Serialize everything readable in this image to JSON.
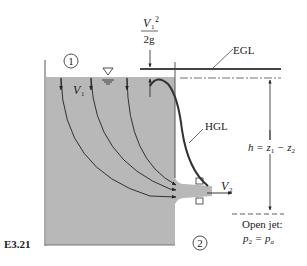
{
  "figure": {
    "label": "E3.21"
  },
  "labels": {
    "station1": "1",
    "station2": "2",
    "velocity_head_num_V": "V",
    "velocity_head_num_sub": "1",
    "velocity_head_num_sup": "2",
    "velocity_head_den": "2g",
    "egl": "EGL",
    "hgl": "HGL",
    "v1_V": "V",
    "v1_sub": "1",
    "v2_V": "V",
    "v2_sub": "2",
    "head_h": "h",
    "head_eq": " = z",
    "head_sub1": "1",
    "head_minus": " − z",
    "head_sub2": "2",
    "open_jet_line1": "Open jet:",
    "open_jet_p": "p",
    "open_jet_sub2": "2",
    "open_jet_eq": " = p",
    "open_jet_suba": "a"
  },
  "colors": {
    "water": "#b8b8b8",
    "line": "#222222",
    "background": "#ffffff"
  }
}
